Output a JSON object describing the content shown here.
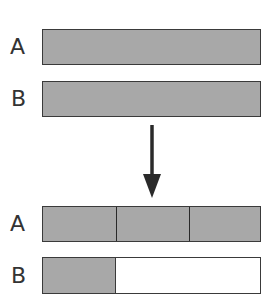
{
  "diagram": {
    "before": {
      "rows": [
        {
          "label": "A",
          "segments": 1,
          "filled_fraction": 1.0
        },
        {
          "label": "B",
          "segments": 1,
          "filled_fraction": 1.0
        }
      ]
    },
    "arrow": {
      "direction": "down",
      "icon": "down-arrow-icon"
    },
    "after": {
      "rows": [
        {
          "label": "A",
          "segments": 3,
          "filled_fraction": 1.0
        },
        {
          "label": "B",
          "segments": 3,
          "filled_fraction": 0.333
        }
      ]
    },
    "colors": {
      "fill": "#a8a8a8",
      "empty": "#ffffff",
      "border": "#3a3a3a"
    }
  }
}
